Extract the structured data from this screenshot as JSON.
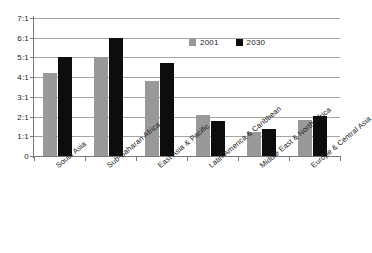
{
  "chart_data": {
    "type": "bar",
    "title": "",
    "subtitle": "",
    "xlabel": "",
    "ylabel": "",
    "categories": [
      "South Asia",
      "Sub-Saharan Africa",
      "East Asia & Pacific",
      "Latin America & Caribbean",
      "Middle East & North Africa",
      "Europe & Central Asia"
    ],
    "series": [
      {
        "name": "2001",
        "color": "#999999",
        "values": [
          4.2,
          5.0,
          3.8,
          2.1,
          1.2,
          1.85
        ]
      },
      {
        "name": "2030",
        "color": "#0d0d0d",
        "values": [
          5.0,
          6.0,
          4.7,
          1.8,
          1.35,
          2.05
        ]
      }
    ],
    "ylim": [
      0,
      7
    ],
    "ytick_values": [
      0,
      1,
      2,
      3,
      4,
      5,
      6,
      7
    ],
    "ytick_labels": [
      "0",
      "1:1",
      "2:1",
      "3:1",
      "4:1",
      "5:1",
      "6:1",
      "7:1"
    ],
    "grid": true,
    "grid_axis": "y",
    "legend": true,
    "legend_position": "top-right-inside",
    "annotations": []
  },
  "legend": {
    "items": [
      {
        "label": "2001"
      },
      {
        "label": "2030"
      }
    ]
  }
}
